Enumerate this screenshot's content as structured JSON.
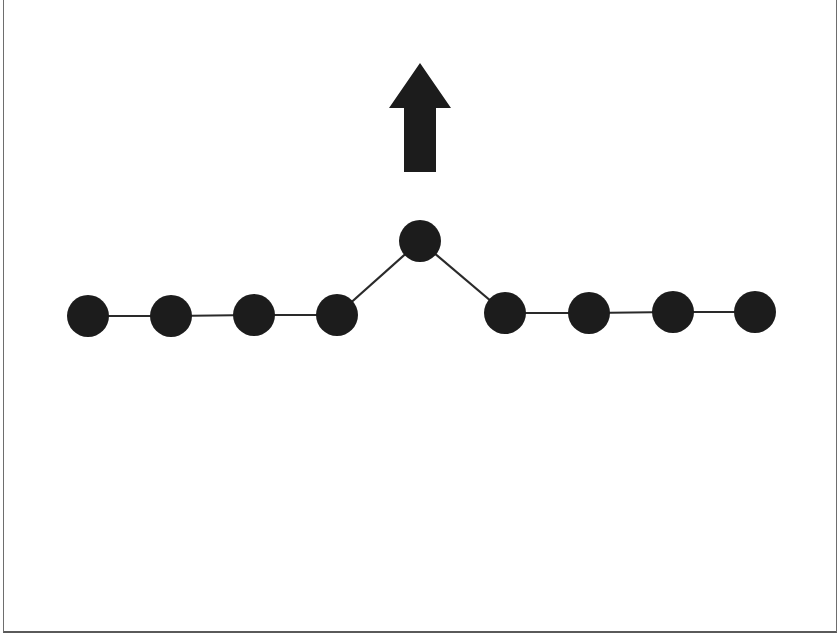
{
  "diagram": {
    "colors": {
      "node": "#1c1c1c",
      "edge": "#2a2a2a",
      "arrow": "#1c1c1c",
      "frame": "#6e6e6e",
      "background": "#ffffff"
    },
    "node_radius": 21,
    "nodes": [
      {
        "id": "n1",
        "x": 88,
        "y": 316
      },
      {
        "id": "n2",
        "x": 171,
        "y": 316
      },
      {
        "id": "n3",
        "x": 254,
        "y": 315
      },
      {
        "id": "n4",
        "x": 337,
        "y": 315
      },
      {
        "id": "n5",
        "x": 420,
        "y": 241,
        "raised": true
      },
      {
        "id": "n6",
        "x": 505,
        "y": 313
      },
      {
        "id": "n7",
        "x": 589,
        "y": 313
      },
      {
        "id": "n8",
        "x": 673,
        "y": 312
      },
      {
        "id": "n9",
        "x": 755,
        "y": 312
      }
    ],
    "edges": [
      [
        "n1",
        "n2"
      ],
      [
        "n2",
        "n3"
      ],
      [
        "n3",
        "n4"
      ],
      [
        "n4",
        "n5"
      ],
      [
        "n5",
        "n6"
      ],
      [
        "n6",
        "n7"
      ],
      [
        "n7",
        "n8"
      ],
      [
        "n8",
        "n9"
      ]
    ],
    "arrow": {
      "direction": "up",
      "tip": [
        420,
        63
      ],
      "head_base_y": 108,
      "head_left_x": 389,
      "head_right_x": 451,
      "shaft_left_x": 404,
      "shaft_right_x": 436,
      "shaft_bottom_y": 172
    }
  }
}
